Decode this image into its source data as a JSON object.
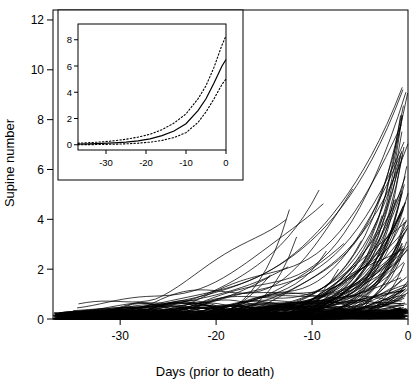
{
  "chart_data": {
    "type": "line",
    "title": "",
    "xlabel": "Days (prior to death)",
    "ylabel": "Supine number",
    "xlim": [
      -37,
      0
    ],
    "ylim": [
      0,
      12.4
    ],
    "xticks": [
      -30,
      -20,
      -10,
      0
    ],
    "xtick_labels": [
      "-30",
      "-20",
      "-10",
      "0"
    ],
    "yticks": [
      0,
      2,
      4,
      6,
      8,
      10,
      12
    ],
    "ytick_labels": [
      "0",
      "2",
      "4",
      "6",
      "8",
      "10",
      "12"
    ],
    "grid": false,
    "legend": "none",
    "n_trajectories": 120,
    "series_note": "Each thin black line is one subject.",
    "inset": {
      "type": "line",
      "xlabel": "",
      "ylabel": "",
      "xlim": [
        -37,
        0
      ],
      "ylim": [
        -0.4,
        9.2
      ],
      "xticks": [
        -30,
        -20,
        -10,
        0
      ],
      "xtick_labels": [
        "-30",
        "-20",
        "-10",
        "0"
      ],
      "yticks": [
        0,
        2,
        4,
        6,
        8
      ],
      "ytick_labels": [
        "0",
        "2",
        "4",
        "6",
        "8"
      ],
      "grid": false,
      "description": "Population mean curve (solid) with pointwise confidence bands (dotted).",
      "series": [
        {
          "name": "mean",
          "style": "solid",
          "x": [
            -37,
            -34,
            -31,
            -28,
            -25,
            -22,
            -19,
            -16,
            -13,
            -10,
            -7,
            -5,
            -3,
            -1,
            0
          ],
          "values": [
            0.05,
            0.07,
            0.1,
            0.14,
            0.2,
            0.3,
            0.45,
            0.7,
            1.05,
            1.6,
            2.6,
            3.5,
            4.7,
            6.0,
            6.5
          ]
        },
        {
          "name": "upper-confidence-band",
          "style": "dotted",
          "x": [
            -37,
            -34,
            -31,
            -28,
            -25,
            -22,
            -19,
            -16,
            -13,
            -10,
            -7,
            -5,
            -3,
            -1,
            0
          ],
          "values": [
            0.12,
            0.16,
            0.22,
            0.3,
            0.42,
            0.58,
            0.8,
            1.15,
            1.65,
            2.35,
            3.5,
            4.5,
            5.9,
            7.6,
            8.3
          ]
        },
        {
          "name": "lower-confidence-band",
          "style": "dotted",
          "x": [
            -37,
            -34,
            -31,
            -28,
            -25,
            -22,
            -19,
            -16,
            -13,
            -10,
            -7,
            -5,
            -3,
            -1,
            0
          ],
          "values": [
            0.0,
            0.01,
            0.02,
            0.04,
            0.07,
            0.12,
            0.2,
            0.33,
            0.55,
            0.92,
            1.7,
            2.5,
            3.5,
            4.6,
            5.0
          ]
        }
      ]
    }
  },
  "colors": {
    "axis": "#000000",
    "trajectory": "#000000",
    "background": "#ffffff"
  }
}
